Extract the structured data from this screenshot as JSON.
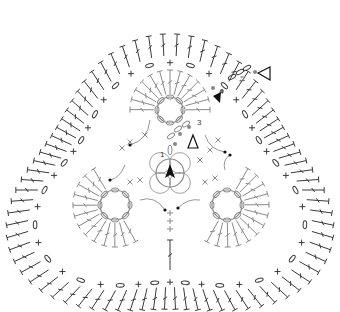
{
  "colors": {
    "outer": "#3a3a3a",
    "inner": "#8a8a8a",
    "marker": "#111111",
    "dot": "#888888",
    "background": "#ffffff"
  },
  "round_labels": [
    {
      "text": "1",
      "x": 160,
      "y": 151
    },
    {
      "text": "3",
      "x": 197,
      "y": 119
    },
    {
      "text": "4",
      "x": 219,
      "y": 88
    },
    {
      "text": "5",
      "x": 240,
      "y": 75
    }
  ],
  "symbols": {
    "start_marker": "filled-triangle",
    "join_marker": "open-triangle",
    "stitches": [
      "double-crochet",
      "single-crochet",
      "chain",
      "slip-stitch"
    ]
  },
  "centers": [
    {
      "name": "top-flower",
      "x": 170,
      "y": 110,
      "r": 13
    },
    {
      "name": "left-flower",
      "x": 115,
      "y": 205,
      "r": 15
    },
    {
      "name": "right-flower",
      "x": 227,
      "y": 205,
      "r": 15
    },
    {
      "name": "center-ring",
      "x": 170,
      "y": 173,
      "r": 14
    }
  ]
}
